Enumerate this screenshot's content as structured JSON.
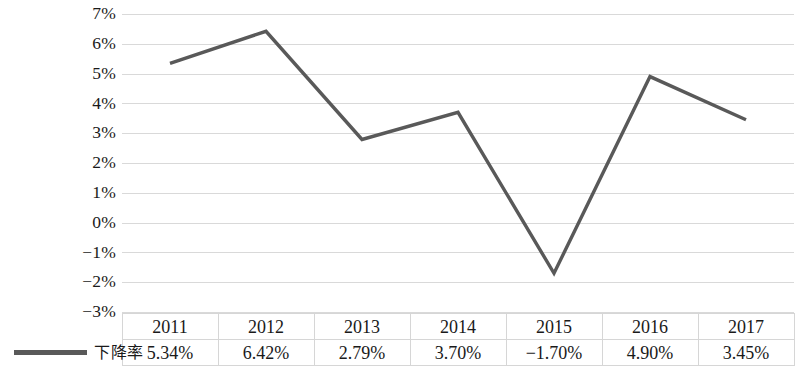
{
  "chart_data": {
    "type": "line",
    "title": "",
    "xlabel": "",
    "ylabel": "",
    "categories": [
      "2011",
      "2012",
      "2013",
      "2014",
      "2015",
      "2016",
      "2017"
    ],
    "series": [
      {
        "name": "下降率",
        "values": [
          5.34,
          6.42,
          2.79,
          3.7,
          -1.7,
          4.9,
          3.45
        ],
        "value_labels": [
          "5.34%",
          "6.42%",
          "2.79%",
          "3.70%",
          "−1.70%",
          "4.90%",
          "3.45%"
        ],
        "color": "#595959"
      }
    ],
    "ylim": [
      -3,
      7
    ],
    "ytick_labels": [
      "7%",
      "6%",
      "5%",
      "4%",
      "3%",
      "2%",
      "1%",
      "0%",
      "−1%",
      "−2%",
      "−3%"
    ],
    "ytick_values": [
      7,
      6,
      5,
      4,
      3,
      2,
      1,
      0,
      -1,
      -2,
      -3
    ],
    "grid": true,
    "legend_position": "bottom-left",
    "has_data_table": true
  },
  "table": {
    "header_row": [
      "2011",
      "2012",
      "2013",
      "2014",
      "2015",
      "2016",
      "2017"
    ],
    "value_row": [
      "5.34%",
      "6.42%",
      "2.79%",
      "3.70%",
      "−1.70%",
      "4.90%",
      "3.45%"
    ],
    "legend_label": "下降率"
  },
  "colors": {
    "series_line": "#595959",
    "gridline": "#d9d9d9",
    "table_border": "#d6d6d6",
    "text": "#1a1a1a"
  }
}
